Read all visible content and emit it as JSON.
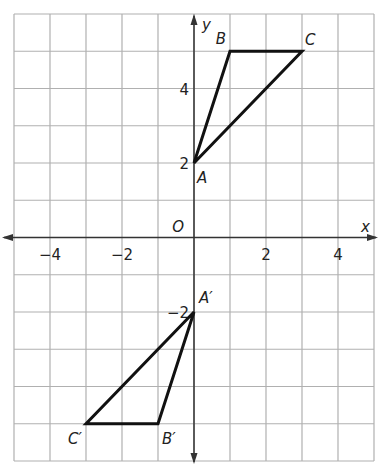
{
  "chart_data": {
    "type": "scatter",
    "title": "",
    "xlabel": "x",
    "ylabel": "y",
    "origin_label": "O",
    "xlim": [
      -5,
      5
    ],
    "ylim": [
      -6,
      6
    ],
    "grid": true,
    "x_ticks": [
      {
        "value": -4,
        "label": "−4"
      },
      {
        "value": -2,
        "label": "−2"
      },
      {
        "value": 2,
        "label": "2"
      },
      {
        "value": 4,
        "label": "4"
      }
    ],
    "y_ticks": [
      {
        "value": 4,
        "label": "4"
      },
      {
        "value": 2,
        "label": "2"
      },
      {
        "value": -2,
        "label": "−2"
      }
    ],
    "series": [
      {
        "name": "Triangle ABC",
        "points": [
          {
            "label": "A",
            "x": 0,
            "y": 2
          },
          {
            "label": "B",
            "x": 1,
            "y": 5
          },
          {
            "label": "C",
            "x": 3,
            "y": 5
          }
        ]
      },
      {
        "name": "Triangle A'B'C'",
        "points": [
          {
            "label": "A′",
            "x": 0,
            "y": -2
          },
          {
            "label": "B′",
            "x": -1,
            "y": -5
          },
          {
            "label": "C′",
            "x": -3,
            "y": -5
          }
        ]
      }
    ]
  },
  "colors": {
    "grid": "#b0b0b0",
    "axis": "#333333",
    "shape": "#111111"
  }
}
